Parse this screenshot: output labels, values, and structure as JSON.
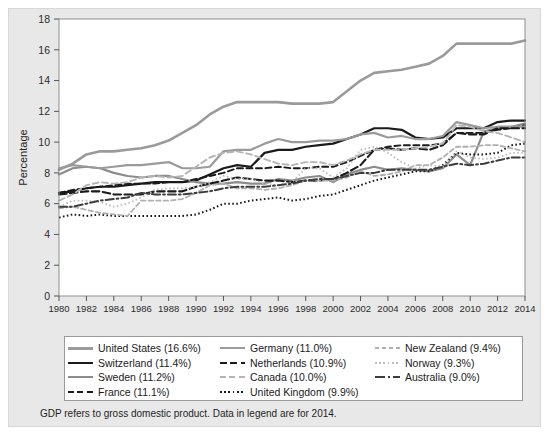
{
  "figure": {
    "background_color": "#ffffff",
    "panel_color": "#e8e8e8",
    "plot_color": "#ffffff"
  },
  "axes": {
    "ylabel": "Percentage",
    "ylim": [
      0,
      18
    ],
    "yticks": [
      0,
      2,
      4,
      6,
      8,
      10,
      12,
      14,
      16,
      18
    ],
    "ytick_labels": [
      "0",
      "2",
      "4",
      "6",
      "8",
      "10",
      "12",
      "14",
      "16",
      "18"
    ],
    "xlim": [
      1980,
      2014
    ],
    "xticks": [
      1980,
      1982,
      1984,
      1986,
      1988,
      1990,
      1992,
      1994,
      1996,
      1998,
      2000,
      2002,
      2004,
      2006,
      2008,
      2010,
      2012,
      2014
    ],
    "xtick_labels": [
      "1980",
      "1982",
      "1984",
      "1986",
      "1988",
      "1990",
      "1992",
      "1994",
      "1996",
      "1998",
      "2000",
      "2002",
      "2004",
      "2006",
      "2008",
      "2010",
      "2012",
      "2014"
    ],
    "grid": false
  },
  "footnote": "GDP refers to gross domestic product. Data in legend are for 2014.",
  "legend": {
    "columns": [
      [
        {
          "label": "United States (16.6%)",
          "series_key": "united_states"
        },
        {
          "label": "Switzerland (11.4%)",
          "series_key": "switzerland"
        },
        {
          "label": "Sweden (11.2%)",
          "series_key": "sweden"
        },
        {
          "label": "France (11.1%)",
          "series_key": "france"
        }
      ],
      [
        {
          "label": "Germany (11.0%)",
          "series_key": "germany"
        },
        {
          "label": "Netherlands (10.9%)",
          "series_key": "netherlands"
        },
        {
          "label": "Canada (10.0%)",
          "series_key": "canada"
        },
        {
          "label": "United Kingdom (9.9%)",
          "series_key": "united_kingdom"
        }
      ],
      [
        {
          "label": "New Zealand (9.4%)",
          "series_key": "new_zealand"
        },
        {
          "label": "Norway (9.3%)",
          "series_key": "norway"
        },
        {
          "label": "Australia (9.0%)",
          "series_key": "australia"
        }
      ]
    ]
  },
  "chart_data": {
    "type": "line",
    "title": "",
    "xlabel": "",
    "ylabel": "Percentage",
    "xlim": [
      1980,
      2014
    ],
    "ylim": [
      0,
      18
    ],
    "grid": false,
    "legend_position": "bottom",
    "x": [
      1980,
      1981,
      1982,
      1983,
      1984,
      1985,
      1986,
      1987,
      1988,
      1989,
      1990,
      1991,
      1992,
      1993,
      1994,
      1995,
      1996,
      1997,
      1998,
      1999,
      2000,
      2001,
      2002,
      2003,
      2004,
      2005,
      2006,
      2007,
      2008,
      2009,
      2010,
      2011,
      2012,
      2013,
      2014
    ],
    "series": [
      {
        "name": "United States",
        "key": "united_states",
        "value_2014": 16.6,
        "color": "#9a9a9a",
        "style": "solid",
        "width": 2.6,
        "values": [
          8.2,
          8.6,
          9.2,
          9.4,
          9.4,
          9.5,
          9.6,
          9.8,
          10.1,
          10.6,
          11.1,
          11.8,
          12.3,
          12.6,
          12.6,
          12.6,
          12.6,
          12.5,
          12.5,
          12.5,
          12.6,
          13.3,
          14.0,
          14.5,
          14.6,
          14.7,
          14.9,
          15.1,
          15.6,
          16.4,
          16.4,
          16.4,
          16.4,
          16.4,
          16.6
        ]
      },
      {
        "name": "Switzerland",
        "key": "switzerland",
        "value_2014": 11.4,
        "color": "#1a1a1a",
        "style": "solid",
        "width": 2.2,
        "values": [
          6.7,
          6.8,
          7.0,
          7.1,
          7.1,
          7.2,
          7.3,
          7.4,
          7.4,
          7.4,
          7.5,
          7.9,
          8.3,
          8.5,
          8.4,
          9.3,
          9.5,
          9.5,
          9.7,
          9.8,
          9.9,
          10.2,
          10.5,
          10.9,
          10.9,
          10.8,
          10.3,
          10.2,
          10.3,
          10.9,
          10.9,
          10.9,
          11.3,
          11.4,
          11.4
        ]
      },
      {
        "name": "Sweden",
        "key": "sweden",
        "value_2014": 11.2,
        "color": "#8c8c8c",
        "style": "solid",
        "width": 2.2,
        "values": [
          7.9,
          8.3,
          8.4,
          8.3,
          8.0,
          7.8,
          7.7,
          7.8,
          7.8,
          7.6,
          7.4,
          7.3,
          7.3,
          7.4,
          7.3,
          7.3,
          7.6,
          7.5,
          7.7,
          7.8,
          7.4,
          7.9,
          8.2,
          8.4,
          8.2,
          8.3,
          8.2,
          8.1,
          8.3,
          9.2,
          8.5,
          10.7,
          10.9,
          11.0,
          11.2
        ]
      },
      {
        "name": "France",
        "key": "france",
        "value_2014": 11.1,
        "color": "#1a1a1a",
        "style": "dashed",
        "width": 1.9,
        "values": [
          6.7,
          6.9,
          7.0,
          7.1,
          7.2,
          7.3,
          7.3,
          7.3,
          7.4,
          7.4,
          7.6,
          7.8,
          8.0,
          8.3,
          8.3,
          8.3,
          8.4,
          8.3,
          8.3,
          8.4,
          8.4,
          8.7,
          9.1,
          9.5,
          9.7,
          9.8,
          9.8,
          9.8,
          9.9,
          10.6,
          10.6,
          10.6,
          10.8,
          10.9,
          11.1
        ]
      },
      {
        "name": "Germany",
        "key": "germany",
        "value_2014": 11.0,
        "color": "#9a9a9a",
        "style": "solid",
        "width": 2.2,
        "values": [
          8.3,
          8.5,
          8.4,
          8.3,
          8.4,
          8.5,
          8.5,
          8.6,
          8.7,
          8.3,
          8.3,
          8.4,
          9.4,
          9.5,
          9.5,
          9.9,
          10.2,
          10.0,
          10.0,
          10.1,
          10.1,
          10.2,
          10.5,
          10.6,
          10.3,
          10.4,
          10.2,
          10.2,
          10.4,
          11.3,
          11.1,
          10.9,
          11.0,
          11.0,
          11.0
        ]
      },
      {
        "name": "Netherlands",
        "key": "netherlands",
        "value_2014": 10.9,
        "color": "#1a1a1a",
        "style": "dashed-long",
        "width": 2.1,
        "values": [
          6.6,
          6.7,
          6.8,
          6.8,
          6.6,
          6.6,
          6.6,
          6.8,
          6.8,
          6.8,
          7.1,
          7.3,
          7.5,
          7.7,
          7.6,
          7.5,
          7.5,
          7.4,
          7.5,
          7.5,
          7.6,
          8.0,
          8.5,
          9.5,
          9.6,
          9.5,
          9.6,
          9.5,
          9.8,
          10.6,
          10.5,
          10.5,
          10.9,
          10.9,
          10.9
        ]
      },
      {
        "name": "Canada",
        "key": "canada",
        "value_2014": 10.0,
        "color": "#b5b5b5",
        "style": "dashed",
        "width": 1.9,
        "values": [
          6.2,
          6.6,
          7.2,
          7.4,
          7.3,
          7.4,
          7.7,
          7.8,
          7.7,
          7.8,
          8.4,
          9.0,
          9.3,
          9.4,
          9.2,
          8.9,
          8.6,
          8.5,
          8.7,
          8.7,
          8.5,
          8.8,
          9.2,
          9.5,
          9.5,
          9.5,
          9.6,
          9.7,
          9.9,
          11.1,
          11.0,
          10.7,
          10.6,
          10.3,
          10.0
        ]
      },
      {
        "name": "United Kingdom",
        "key": "united_kingdom",
        "value_2014": 9.9,
        "color": "#1a1a1a",
        "style": "dotted",
        "width": 2.0,
        "values": [
          5.1,
          5.3,
          5.2,
          5.3,
          5.2,
          5.2,
          5.2,
          5.2,
          5.2,
          5.2,
          5.3,
          5.6,
          6.0,
          6.0,
          6.2,
          6.3,
          6.4,
          6.2,
          6.3,
          6.5,
          6.6,
          6.9,
          7.2,
          7.5,
          7.7,
          7.9,
          8.1,
          8.1,
          8.5,
          9.3,
          9.2,
          9.2,
          9.3,
          9.8,
          9.9
        ]
      },
      {
        "name": "New Zealand",
        "key": "new_zealand",
        "value_2014": 9.4,
        "color": "#b0b0b0",
        "style": "dashed-short",
        "width": 1.8,
        "values": [
          5.7,
          5.8,
          5.6,
          5.4,
          5.3,
          5.2,
          6.2,
          6.2,
          6.2,
          6.3,
          6.7,
          7.2,
          7.3,
          7.0,
          7.0,
          6.9,
          7.0,
          7.2,
          7.5,
          7.5,
          7.5,
          7.7,
          8.1,
          7.8,
          7.9,
          8.1,
          8.5,
          8.5,
          9.0,
          9.7,
          9.7,
          9.8,
          9.8,
          9.6,
          9.4
        ]
      },
      {
        "name": "Norway",
        "key": "norway",
        "value_2014": 9.3,
        "color": "#bdbdbd",
        "style": "dotted",
        "width": 1.8,
        "values": [
          5.8,
          6.2,
          6.2,
          6.1,
          5.8,
          6.0,
          6.4,
          6.9,
          7.0,
          7.0,
          7.1,
          7.4,
          7.8,
          7.6,
          7.6,
          7.3,
          7.2,
          7.4,
          8.3,
          8.3,
          7.7,
          8.3,
          9.5,
          9.7,
          9.3,
          8.7,
          8.3,
          8.5,
          8.4,
          9.4,
          9.0,
          8.9,
          9.0,
          9.3,
          9.3
        ]
      },
      {
        "name": "Australia",
        "key": "australia",
        "value_2014": 9.0,
        "color": "#3d3d3d",
        "style": "dashdot",
        "width": 2.0,
        "values": [
          5.8,
          5.8,
          6.0,
          6.2,
          6.3,
          6.4,
          6.7,
          6.6,
          6.6,
          6.6,
          6.7,
          6.8,
          7.0,
          7.1,
          7.1,
          7.1,
          7.2,
          7.3,
          7.5,
          7.6,
          7.6,
          7.8,
          8.0,
          8.0,
          8.2,
          8.2,
          8.2,
          8.2,
          8.4,
          8.6,
          8.5,
          8.6,
          8.8,
          9.0,
          9.0
        ]
      }
    ]
  }
}
